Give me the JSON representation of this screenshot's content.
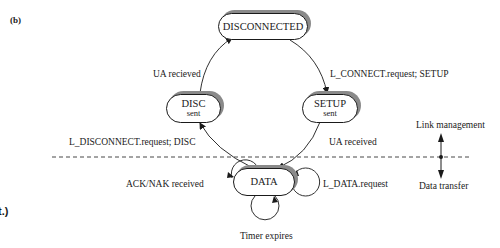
{
  "figure": {
    "panel_label": "(b)",
    "continuation_fragment": "t.)"
  },
  "states": {
    "disconnected": {
      "label": "DISCONNECTED"
    },
    "disc_sent": {
      "label": "DISC",
      "sublabel": "sent"
    },
    "setup_sent": {
      "label": "SETUP",
      "sublabel": "sent"
    },
    "data": {
      "label": "DATA"
    }
  },
  "transitions": {
    "disc_to_disconnected": "UA recieved",
    "disconnected_to_setup": "L_CONNECT.request; SETUP",
    "data_to_disc": "L_DISCONNECT.request; DISC",
    "setup_to_data": "UA received",
    "data_self_left": "ACK/NAK received",
    "data_self_right": "L_DATA.request",
    "data_self_bottom": "Timer expires"
  },
  "legend": {
    "upper": "Link management",
    "lower": "Data transfer"
  },
  "colors": {
    "line": "#1a1a1a",
    "shadow": "#8a8a8a",
    "background": "#ffffff"
  }
}
